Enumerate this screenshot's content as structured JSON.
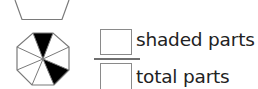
{
  "figure": {
    "top_shape": "partial-trapezoid",
    "octagon": {
      "total_parts": 8,
      "shaded_parts": 2,
      "shade_color": "#000000",
      "line_color": "#7a7a7a"
    }
  },
  "fraction": {
    "numerator_label": "shaded parts",
    "denominator_label": "total parts",
    "numerator_value": "",
    "denominator_value": ""
  }
}
